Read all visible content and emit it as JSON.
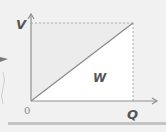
{
  "diagram": {
    "type": "V-Q triangle",
    "y_axis_label": "V",
    "x_axis_label": "Q",
    "origin_label": "0",
    "area_label": "W",
    "colors": {
      "background": "#f1f1f1",
      "area_fill": "#ffffff",
      "axis": "#909090",
      "line": "#8a8a8a",
      "dashed": "#a8a8a8",
      "label": "#555555",
      "side_arrow": "#7a7a7a"
    }
  }
}
